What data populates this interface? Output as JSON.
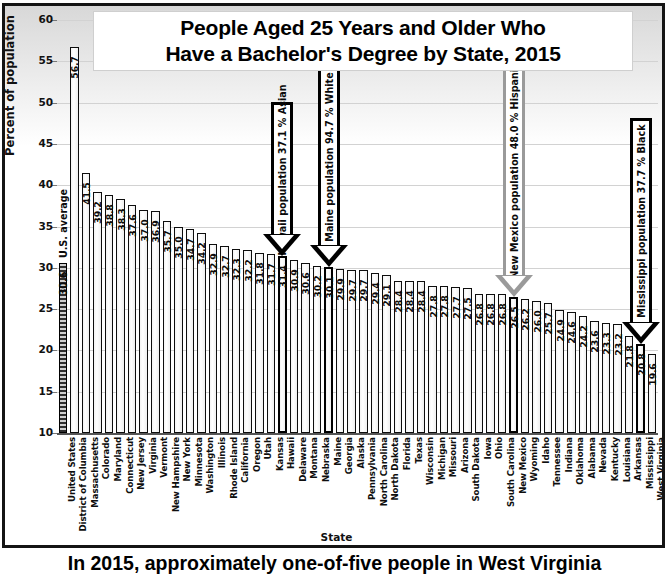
{
  "chart_data": {
    "type": "bar",
    "title": "People Aged 25 Years and Older Who Have a Bachelor's Degree by State, 2015",
    "title_line1": "People Aged 25 Years and Older Who",
    "title_line2": "Have a Bachelor's Degree by State, 2015",
    "xlabel": "State",
    "ylabel": "Percent of population",
    "ylim": [
      10,
      60
    ],
    "ytick_labels": [
      "60",
      "55",
      "50",
      "45",
      "40",
      "35",
      "30",
      "25",
      "20",
      "15",
      "10"
    ],
    "ytick_values": [
      60,
      55,
      50,
      45,
      40,
      35,
      30,
      25,
      20,
      15,
      10
    ],
    "grid": true,
    "legend": "none",
    "reference_label": "U.S. average",
    "categories": [
      "United States",
      "District of Columbia",
      "Massachusetts",
      "Colorado",
      "Maryland",
      "Connecticut",
      "New Jersey",
      "Virginia",
      "Vermont",
      "New Hampshire",
      "New York",
      "Minnesota",
      "Washington",
      "Illinois",
      "Rhode Island",
      "California",
      "Oregon",
      "Utah",
      "Kansas",
      "Hawaii",
      "Delaware",
      "Montana",
      "Nebraska",
      "Maine",
      "Georgia",
      "Alaska",
      "Pennsylvania",
      "North Carolina",
      "North Dakota",
      "Florida",
      "Texas",
      "Wisconsin",
      "Michigan",
      "Missouri",
      "Arizona",
      "South Dakota",
      "Iowa",
      "Ohio",
      "South Carolina",
      "New Mexico",
      "Wyoming",
      "Idaho",
      "Tennessee",
      "Indiana",
      "Oklahoma",
      "Alabama",
      "Nevada",
      "Kentucky",
      "Louisiana",
      "Arkansas",
      "Mississippi",
      "West Virginia"
    ],
    "values": [
      30.6,
      56.7,
      41.5,
      39.2,
      38.8,
      38.3,
      37.6,
      37.0,
      36.9,
      35.7,
      35.0,
      34.7,
      34.2,
      32.9,
      32.7,
      32.3,
      32.2,
      31.8,
      31.7,
      31.4,
      30.9,
      30.6,
      30.2,
      30.1,
      29.9,
      29.7,
      29.7,
      29.4,
      29.1,
      28.4,
      28.4,
      28.4,
      27.8,
      27.8,
      27.7,
      27.5,
      26.8,
      26.8,
      26.8,
      26.5,
      26.2,
      26.0,
      25.7,
      24.9,
      24.6,
      24.2,
      23.6,
      23.3,
      23.2,
      21.8,
      20.8,
      19.6
    ],
    "highlighted": [
      "Hawaii",
      "Maine",
      "New Mexico",
      "Mississippi"
    ],
    "annotations": [
      {
        "target": "Hawaii",
        "text": "Hawaii population 37.1 % Asian",
        "style": "dark"
      },
      {
        "target": "Maine",
        "text": "Maine population 94.7 % White",
        "style": "dark"
      },
      {
        "target": "New Mexico",
        "text": "New Mexico population 48.0 % Hispanic",
        "style": "light"
      },
      {
        "target": "Mississippi",
        "text": "Mississippi population 37.7 % Black",
        "style": "dark"
      }
    ]
  },
  "caption": {
    "text": "In 2015, approximately one-of-five people in West Virginia"
  },
  "colors": {
    "bar_outline": "#0d0d0d",
    "grid": "#d2d2d2",
    "highlight_outline": "#000000",
    "light_arrow": "#9a9a9a",
    "panel_border": "#141414"
  }
}
